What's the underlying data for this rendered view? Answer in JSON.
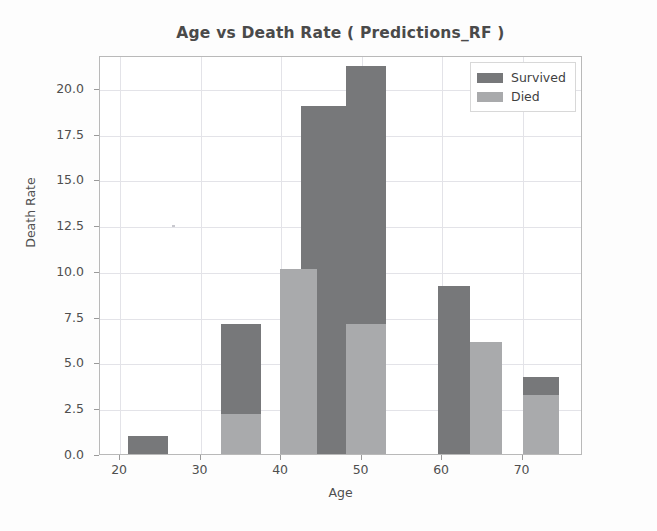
{
  "chart_data": {
    "type": "bar",
    "title": "Age vs Death Rate ( Predictions_RF )",
    "xlabel": "Age",
    "ylabel": "Death Rate",
    "xlim": [
      17.5,
      77.5
    ],
    "ylim": [
      0,
      21.8
    ],
    "xticks": [
      20,
      30,
      40,
      50,
      60,
      70
    ],
    "xtick_labels": [
      "20",
      "30",
      "40",
      "50",
      "60",
      "70"
    ],
    "yticks": [
      0.0,
      2.5,
      5.0,
      7.5,
      10.0,
      12.5,
      15.0,
      17.5,
      20.0
    ],
    "ytick_labels": [
      "0.0",
      "2.5",
      "5.0",
      "7.5",
      "10.0",
      "12.5",
      "15.0",
      "17.5",
      "20.0"
    ],
    "grid": true,
    "legend_position": "upper right",
    "series": [
      {
        "name": "Survived",
        "color": "#77787a",
        "bars": [
          {
            "x_start": 21.0,
            "x_end": 26.0,
            "value": 1.0
          },
          {
            "x_start": 32.5,
            "x_end": 37.5,
            "value": 7.1
          },
          {
            "x_start": 42.5,
            "x_end": 48.0,
            "value": 19.0
          },
          {
            "x_start": 48.0,
            "x_end": 53.0,
            "value": 21.2
          },
          {
            "x_start": 59.5,
            "x_end": 63.5,
            "value": 9.2
          },
          {
            "x_start": 70.0,
            "x_end": 74.5,
            "value": 4.2
          }
        ]
      },
      {
        "name": "Died",
        "color": "#a9aaac",
        "bars": [
          {
            "x_start": 32.5,
            "x_end": 37.5,
            "value": 2.2
          },
          {
            "x_start": 39.8,
            "x_end": 44.5,
            "value": 10.1
          },
          {
            "x_start": 48.0,
            "x_end": 53.0,
            "value": 7.1
          },
          {
            "x_start": 63.5,
            "x_end": 67.5,
            "value": 6.1
          },
          {
            "x_start": 70.0,
            "x_end": 74.5,
            "value": 3.2
          }
        ]
      }
    ]
  },
  "legend": {
    "items": [
      {
        "label": "Survived",
        "swatch_class": "survived"
      },
      {
        "label": "Died",
        "swatch_class": "died"
      }
    ]
  }
}
